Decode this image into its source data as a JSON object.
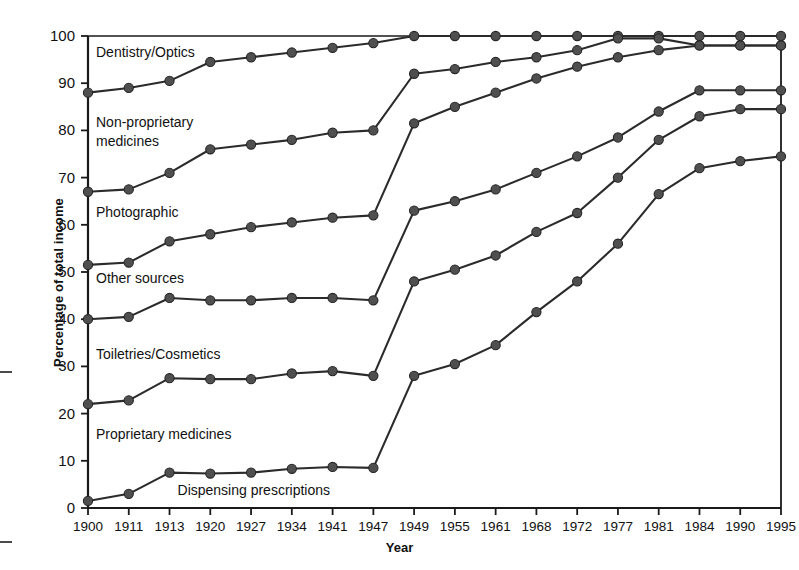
{
  "chart_data": {
    "type": "line",
    "title": "",
    "xlabel": "Year",
    "ylabel": "Percentage of total income",
    "categories": [
      "1900",
      "1911",
      "1913",
      "1920",
      "1927",
      "1934",
      "1941",
      "1947",
      "1949",
      "1955",
      "1961",
      "1968",
      "1972",
      "1977",
      "1981",
      "1984",
      "1990",
      "1995"
    ],
    "ylim": [
      0,
      100
    ],
    "yticks": [
      0,
      10,
      20,
      30,
      40,
      50,
      60,
      70,
      80,
      90,
      100
    ],
    "grid": false,
    "legend_position": "inline-annotations",
    "marker": "filled-circle",
    "series": [
      {
        "name": "Dentistry/Optics",
        "values": [
          88,
          89,
          90.5,
          94.5,
          95.5,
          96.5,
          97.5,
          98.5,
          100,
          100,
          100,
          100,
          100,
          100,
          100,
          100,
          100,
          100
        ]
      },
      {
        "name": "Non-proprietary medicines",
        "values": [
          67,
          67.5,
          71,
          76,
          77,
          78,
          79.5,
          80,
          92,
          93,
          94.5,
          95.5,
          97,
          99.5,
          99.5,
          98,
          98,
          98
        ]
      },
      {
        "name": "Photographic",
        "values": [
          51.5,
          52,
          56.5,
          58,
          59.5,
          60.5,
          61.5,
          62,
          81.5,
          85,
          88,
          91,
          93.5,
          95.5,
          97,
          98,
          98,
          98
        ]
      },
      {
        "name": "Other sources",
        "values": [
          40,
          40.5,
          44.5,
          44,
          44,
          44.5,
          44.5,
          44,
          63,
          65,
          67.5,
          71,
          74.5,
          78.5,
          84,
          88.5,
          88.5,
          88.5
        ]
      },
      {
        "name": "Toiletries/Cosmetics",
        "values": [
          22,
          22.8,
          27.5,
          27.3,
          27.3,
          28.5,
          29,
          28,
          48,
          50.5,
          53.5,
          58.5,
          62.5,
          70,
          78,
          83,
          84.5,
          84.5
        ]
      },
      {
        "name": "Proprietary medicines / Dispensing prescriptions",
        "values": [
          1.5,
          3,
          7.5,
          7.3,
          7.5,
          8.3,
          8.7,
          8.5,
          28,
          30.5,
          34.5,
          41.5,
          48,
          56,
          66.5,
          72,
          73.5,
          74.5
        ]
      }
    ],
    "annotations": [
      {
        "text": "Dentistry/Optics",
        "x_year": "1900",
        "y_value": 96.5
      },
      {
        "text": "Non-proprietary",
        "x_year": "1900",
        "y_value": 81.5
      },
      {
        "text": "medicines",
        "x_year": "1900",
        "y_value": 77.5
      },
      {
        "text": "Photographic",
        "x_year": "1900",
        "y_value": 62.5
      },
      {
        "text": "Other sources",
        "x_year": "1900",
        "y_value": 48.5
      },
      {
        "text": "Toiletries/Cosmetics",
        "x_year": "1900",
        "y_value": 32.5
      },
      {
        "text": "Proprietary medicines",
        "x_year": "1900",
        "y_value": 15.5
      },
      {
        "text": "Dispensing prescriptions",
        "x_year": "1913",
        "y_value": 3.5
      }
    ],
    "colors": {
      "line": "#2b2b2b",
      "marker": "#4f4f4f",
      "axis": "#1a1a1a",
      "background": "#ffffff"
    }
  }
}
